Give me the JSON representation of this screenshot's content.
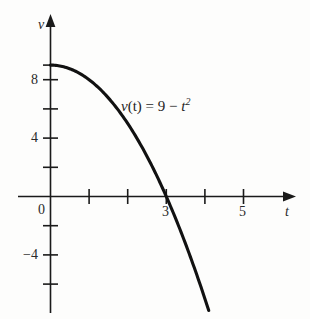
{
  "chart_data": {
    "type": "line",
    "title": "",
    "subtitle": "",
    "xlabel": "t",
    "ylabel": "v",
    "xlim": [
      -0.35,
      6.3
    ],
    "ylim": [
      -8.2,
      10.2
    ],
    "grid": false,
    "legend": null,
    "annotations": [
      {
        "name": "function-equation",
        "parts": {
          "fn": "v",
          "arg": "(t)",
          "eq": " = 9 − ",
          "base": "t",
          "exp": "2"
        },
        "plain_text": "v(t) = 9 − t²",
        "x": 2.1,
        "y": 6.2
      }
    ],
    "x_ticks": [
      {
        "value": 0,
        "label": "0",
        "labeled": true
      },
      {
        "value": 1,
        "label": "",
        "labeled": false
      },
      {
        "value": 2,
        "label": "",
        "labeled": false
      },
      {
        "value": 3,
        "label": "3",
        "labeled": true
      },
      {
        "value": 4,
        "label": "",
        "labeled": false
      },
      {
        "value": 5,
        "label": "5",
        "labeled": true
      }
    ],
    "y_ticks": [
      {
        "value": 9,
        "label": "",
        "labeled": false
      },
      {
        "value": 8,
        "label": "8",
        "labeled": true
      },
      {
        "value": 6,
        "label": "",
        "labeled": false
      },
      {
        "value": 4,
        "label": "4",
        "labeled": true
      },
      {
        "value": 2,
        "label": "",
        "labeled": false
      },
      {
        "value": -2,
        "label": "",
        "labeled": false
      },
      {
        "value": -4,
        "label": "−4",
        "labeled": true
      },
      {
        "value": -6,
        "label": "",
        "labeled": false
      }
    ],
    "series": [
      {
        "name": "v(t) = 9 - t^2",
        "formula": "9 - t*t",
        "color": "#111111",
        "x_start": 0,
        "x_end": 4.1,
        "zero_crossing": 3,
        "y_intercept": 9,
        "points": [
          {
            "t": 0,
            "v": 9
          },
          {
            "t": 0.5,
            "v": 8.75
          },
          {
            "t": 1,
            "v": 8
          },
          {
            "t": 1.5,
            "v": 6.75
          },
          {
            "t": 2,
            "v": 5
          },
          {
            "t": 2.5,
            "v": 2.75
          },
          {
            "t": 3,
            "v": 0
          },
          {
            "t": 3.5,
            "v": -3.25
          },
          {
            "t": 4,
            "v": -7
          },
          {
            "t": 4.1,
            "v": -7.81
          }
        ]
      }
    ]
  },
  "axes": {
    "y_axis_label": "v",
    "x_axis_label": "t",
    "origin_label": "0"
  },
  "colors": {
    "background": "#fdfdfc",
    "axis": "#1a1a1a",
    "curve": "#111111",
    "text": "#2a2a2a"
  }
}
